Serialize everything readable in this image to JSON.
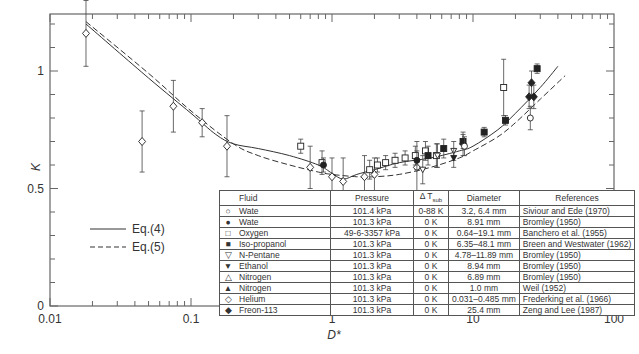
{
  "chart_data": {
    "type": "scatter",
    "title": "",
    "xlabel": "D*",
    "ylabel": "K",
    "xscale": "log",
    "xlim": [
      0.01,
      100
    ],
    "ylim": [
      0,
      1.24
    ],
    "x_ticks": [
      0.01,
      0.1,
      1,
      10,
      100
    ],
    "x_tick_labels": [
      "0.01",
      "0.1",
      "1",
      "10",
      "100"
    ],
    "y_ticks": [
      0,
      0.5,
      1
    ],
    "y_tick_labels": [
      "0",
      "0.5",
      "1"
    ],
    "y_minor_step": 0.1,
    "grid": false,
    "legend_position": "lower-left (lines), lower-right table (markers)",
    "series": [
      {
        "name": "Eq.(4)",
        "style": "solid",
        "kind": "line",
        "x": [
          0.018,
          0.05,
          0.1,
          0.15,
          0.2,
          0.3,
          0.5,
          0.8,
          1.0,
          1.2,
          1.5,
          2,
          3,
          5,
          8,
          10,
          15,
          20,
          30,
          40
        ],
        "y": [
          1.2,
          0.97,
          0.82,
          0.73,
          0.69,
          0.67,
          0.64,
          0.6,
          0.565,
          0.54,
          0.56,
          0.58,
          0.61,
          0.63,
          0.66,
          0.68,
          0.75,
          0.82,
          0.93,
          1.02
        ]
      },
      {
        "name": "Eq.(5)",
        "style": "dashed",
        "kind": "line",
        "x": [
          0.018,
          0.05,
          0.1,
          0.2,
          0.3,
          0.5,
          0.8,
          1.0,
          1.5,
          2,
          3,
          5,
          8,
          10,
          15,
          20,
          30,
          45
        ],
        "y": [
          1.21,
          0.99,
          0.83,
          0.69,
          0.64,
          0.6,
          0.57,
          0.56,
          0.55,
          0.55,
          0.56,
          0.59,
          0.63,
          0.66,
          0.72,
          0.78,
          0.88,
          0.98
        ]
      },
      {
        "name": "Helium (Frederking et al. 1966)",
        "marker": "open-diamond",
        "kind": "points",
        "x": [
          0.018,
          0.045,
          0.075,
          0.12,
          0.18,
          0.7,
          1.0,
          1.2,
          1.7,
          2.0,
          4.0,
          8.5
        ],
        "y": [
          1.16,
          0.7,
          0.85,
          0.78,
          0.68,
          0.59,
          0.55,
          0.53,
          0.55,
          0.56,
          0.59,
          0.69
        ],
        "err": [
          0.14,
          0.13,
          0.11,
          0.06,
          0.13,
          0.09,
          0.08,
          0.1,
          0.09,
          0.07,
          0.11,
          0.05
        ]
      },
      {
        "name": "Oxygen (Banchero et al. 1955)",
        "marker": "open-square",
        "kind": "points",
        "x": [
          0.6,
          0.85,
          1.85,
          2.1,
          2.4,
          2.8,
          3.3,
          3.9,
          4.6,
          5.5,
          16.5
        ],
        "y": [
          0.68,
          0.61,
          0.58,
          0.6,
          0.61,
          0.62,
          0.63,
          0.64,
          0.66,
          0.64,
          0.93
        ],
        "err": [
          0.03,
          0.05,
          0.04,
          0.03,
          0.03,
          0.03,
          0.03,
          0.04,
          0.04,
          0.05,
          0.12
        ]
      },
      {
        "name": "Iso-propanol (Breen and Westwater 1962)",
        "marker": "filled-square",
        "kind": "points",
        "x": [
          4.8,
          6.2,
          8.5,
          12.0,
          17.0,
          28.5
        ],
        "y": [
          0.64,
          0.67,
          0.7,
          0.74,
          0.79,
          1.01
        ],
        "err": [
          0.04,
          0.04,
          0.03,
          0.02,
          0.02,
          0.02
        ]
      },
      {
        "name": "Water 0 K (Bromley 1950)",
        "marker": "filled-circle",
        "kind": "points",
        "x": [
          0.87,
          4.0
        ],
        "y": [
          0.6,
          0.62
        ],
        "err": [
          0.03,
          0.04
        ]
      },
      {
        "name": "Freon-113 (Zeng and Lee 1987)",
        "marker": "filled-diamond",
        "kind": "points",
        "x": [
          25.0,
          26.0,
          27.0
        ],
        "y": [
          0.89,
          0.95,
          0.89
        ],
        "err": [
          0.05,
          0.05,
          0.05
        ]
      },
      {
        "name": "N-Pentane (Bromley 1950)",
        "marker": "open-triangle-down",
        "kind": "points",
        "x": [
          4.4,
          5.6,
          7.3
        ],
        "y": [
          0.58,
          0.64,
          0.66
        ],
        "err": [
          0.06,
          0.05,
          0.04
        ]
      },
      {
        "name": "Ethanol (Bromley 1950)",
        "marker": "filled-triangle-down",
        "kind": "points",
        "x": [
          7.3
        ],
        "y": [
          0.63
        ],
        "err": [
          0.04
        ]
      },
      {
        "name": "Water 0-88 K (Siviour and Ede 1970)",
        "marker": "open-circle",
        "kind": "points",
        "x": [
          8.7,
          25.5
        ],
        "y": [
          0.68,
          0.8
        ],
        "err": [
          0.04,
          0.05
        ]
      }
    ]
  },
  "line_legend": [
    {
      "label": "Eq.(4)",
      "style": "solid"
    },
    {
      "label": "Eq.(5)",
      "style": "dashed"
    }
  ],
  "table": {
    "headers": [
      "Fluid",
      "Pressure",
      "Δ T_sub",
      "Diameter",
      "References"
    ],
    "header_dt_main": "Δ T",
    "header_dt_sub": "sub",
    "rows": [
      {
        "symbol": "○",
        "fluid": "Wate",
        "pressure": "101.4 kPa",
        "dt": "0-88 K",
        "diameter": "3.2, 6.4 mm",
        "ref": "Siviour and Ede (1970)"
      },
      {
        "symbol": "●",
        "fluid": "Wate",
        "pressure": "101.3 kPa",
        "dt": "0 K",
        "diameter": "8.91 mm",
        "ref": "Bromley (1950)"
      },
      {
        "symbol": "□",
        "fluid": "Oxygen",
        "pressure": "49-6-3357 kPa",
        "dt": "0 K",
        "diameter": "0.64–19.1 mm",
        "ref": "Banchero et al. (1955)"
      },
      {
        "symbol": "■",
        "fluid": "Iso-propanol",
        "pressure": "101.3 kPa",
        "dt": "0 K",
        "diameter": "6.35–48.1 mm",
        "ref": "Breen and Westwater (1962)"
      },
      {
        "symbol": "▽",
        "fluid": "N-Pentane",
        "pressure": "101.3 kPa",
        "dt": "0 K",
        "diameter": "4.78–11.89 mm",
        "ref": "Bromley (1950)"
      },
      {
        "symbol": "▼",
        "fluid": "Ethanol",
        "pressure": "101.3 kPa",
        "dt": "0 K",
        "diameter": "8.94 mm",
        "ref": "Bromley (1950)"
      },
      {
        "symbol": "△",
        "fluid": "Nitrogen",
        "pressure": "101.3 kPa",
        "dt": "0 K",
        "diameter": "6.89 mm",
        "ref": "Bromley (1950)"
      },
      {
        "symbol": "▲",
        "fluid": "Nitrogen",
        "pressure": "101.3 kPa",
        "dt": "0 K",
        "diameter": "1.0 mm",
        "ref": "Weil (1952)"
      },
      {
        "symbol": "◇",
        "fluid": "Helium",
        "pressure": "101.3 kPa",
        "dt": "0 K",
        "diameter": "0.031–0.485 mm",
        "ref": "Frederking et al. (1966)"
      },
      {
        "symbol": "◆",
        "fluid": "Freon-113",
        "pressure": "101.3 kPa",
        "dt": "0 K",
        "diameter": "25.4 mm",
        "ref": "Zeng and Lee (1987)"
      }
    ]
  },
  "colors": {
    "line": "#333333",
    "axis": "#555555",
    "marker": "#222222"
  }
}
